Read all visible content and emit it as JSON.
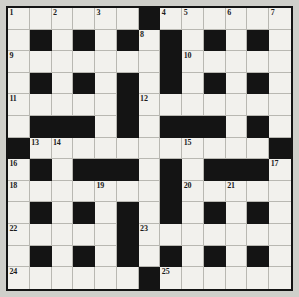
{
  "puzzle": {
    "type": "crossword-grid",
    "rows": 13,
    "columns": 13,
    "colors": {
      "page_background": "#cfcfca",
      "block_cell": "#141414",
      "open_cell": "#f2f1ed",
      "cell_gridline": "#b9b8b2",
      "outer_border": "#141414",
      "number_text": "#1c1c1c"
    },
    "grid": [
      [
        "o",
        "o",
        "o",
        "o",
        "o",
        "o",
        "b",
        "o",
        "o",
        "o",
        "o",
        "o",
        "o"
      ],
      [
        "o",
        "b",
        "o",
        "b",
        "o",
        "b",
        "o",
        "b",
        "o",
        "b",
        "o",
        "b",
        "o"
      ],
      [
        "o",
        "o",
        "o",
        "o",
        "o",
        "o",
        "o",
        "b",
        "o",
        "o",
        "o",
        "o",
        "o"
      ],
      [
        "o",
        "b",
        "o",
        "b",
        "o",
        "b",
        "o",
        "b",
        "o",
        "b",
        "o",
        "b",
        "o"
      ],
      [
        "o",
        "o",
        "o",
        "o",
        "o",
        "b",
        "o",
        "o",
        "o",
        "o",
        "o",
        "o",
        "o"
      ],
      [
        "o",
        "b",
        "b",
        "b",
        "o",
        "b",
        "o",
        "b",
        "b",
        "b",
        "o",
        "b",
        "o"
      ],
      [
        "b",
        "o",
        "o",
        "o",
        "o",
        "o",
        "o",
        "o",
        "o",
        "o",
        "o",
        "o",
        "b"
      ],
      [
        "o",
        "b",
        "o",
        "b",
        "b",
        "b",
        "o",
        "b",
        "o",
        "b",
        "b",
        "b",
        "o"
      ],
      [
        "o",
        "o",
        "o",
        "o",
        "o",
        "o",
        "o",
        "b",
        "o",
        "o",
        "o",
        "o",
        "o"
      ],
      [
        "o",
        "b",
        "o",
        "b",
        "o",
        "b",
        "o",
        "b",
        "o",
        "b",
        "o",
        "b",
        "o"
      ],
      [
        "o",
        "o",
        "o",
        "o",
        "o",
        "b",
        "o",
        "o",
        "o",
        "o",
        "o",
        "o",
        "o"
      ],
      [
        "o",
        "b",
        "o",
        "b",
        "o",
        "b",
        "o",
        "b",
        "o",
        "b",
        "o",
        "b",
        "o"
      ],
      [
        "o",
        "o",
        "o",
        "o",
        "o",
        "o",
        "b",
        "o",
        "o",
        "o",
        "o",
        "o",
        "o"
      ]
    ],
    "numbers": [
      {
        "n": "1",
        "row": 1,
        "col": 1
      },
      {
        "n": "2",
        "row": 1,
        "col": 3
      },
      {
        "n": "3",
        "row": 1,
        "col": 5
      },
      {
        "n": "4",
        "row": 1,
        "col": 8
      },
      {
        "n": "5",
        "row": 1,
        "col": 9
      },
      {
        "n": "6",
        "row": 1,
        "col": 11
      },
      {
        "n": "7",
        "row": 1,
        "col": 13
      },
      {
        "n": "8",
        "row": 2,
        "col": 7
      },
      {
        "n": "9",
        "row": 3,
        "col": 1
      },
      {
        "n": "10",
        "row": 3,
        "col": 9
      },
      {
        "n": "11",
        "row": 5,
        "col": 1
      },
      {
        "n": "12",
        "row": 5,
        "col": 7
      },
      {
        "n": "13",
        "row": 7,
        "col": 2
      },
      {
        "n": "14",
        "row": 7,
        "col": 3
      },
      {
        "n": "15",
        "row": 7,
        "col": 9
      },
      {
        "n": "16",
        "row": 8,
        "col": 1
      },
      {
        "n": "17",
        "row": 8,
        "col": 13
      },
      {
        "n": "18",
        "row": 9,
        "col": 1
      },
      {
        "n": "19",
        "row": 9,
        "col": 5
      },
      {
        "n": "20",
        "row": 9,
        "col": 9
      },
      {
        "n": "21",
        "row": 9,
        "col": 11
      },
      {
        "n": "22",
        "row": 11,
        "col": 1
      },
      {
        "n": "23",
        "row": 11,
        "col": 7
      },
      {
        "n": "24",
        "row": 13,
        "col": 1
      },
      {
        "n": "25",
        "row": 13,
        "col": 8
      }
    ]
  }
}
